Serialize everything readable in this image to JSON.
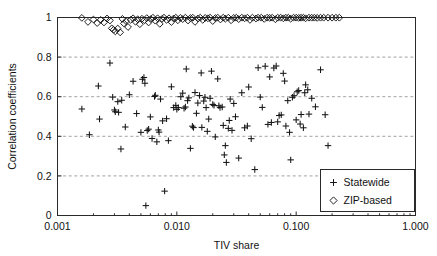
{
  "chart_data": {
    "type": "scatter",
    "title": "",
    "xlabel": "TIV share",
    "ylabel": "Correlation coefficients",
    "xscale": "log",
    "yscale": "linear",
    "xlim": [
      0.001,
      1.0
    ],
    "ylim": [
      0.0,
      1.0
    ],
    "xticks": [
      0.001,
      0.01,
      0.1,
      1.0
    ],
    "xtick_labels": [
      "0.001",
      "0.010",
      "0.100",
      "1.000"
    ],
    "yticks": [
      0,
      0.2,
      0.4,
      0.6,
      0.8,
      1
    ],
    "ytick_labels": [
      "0",
      "0.2",
      "0.4",
      "0.6",
      "0.8",
      "1"
    ],
    "grid": {
      "horizontal": true,
      "vertical": false,
      "style": "dashed",
      "color": "#8a8a8a"
    },
    "legend": {
      "position": "bottom-right",
      "border": true,
      "entries": [
        {
          "label": "Statewide",
          "marker": "plus"
        },
        {
          "label": "ZIP-based",
          "marker": "diamond"
        }
      ]
    },
    "series": [
      {
        "name": "Statewide",
        "marker": "plus",
        "color": "#161616",
        "points": [
          [
            0.0016,
            0.538
          ],
          [
            0.00185,
            0.408
          ],
          [
            0.0022,
            0.654
          ],
          [
            0.00225,
            0.487
          ],
          [
            0.00275,
            0.77
          ],
          [
            0.0029,
            0.598
          ],
          [
            0.003,
            0.533
          ],
          [
            0.00305,
            0.524
          ],
          [
            0.0032,
            0.575
          ],
          [
            0.00325,
            0.521
          ],
          [
            0.0034,
            0.336
          ],
          [
            0.00345,
            0.582
          ],
          [
            0.0037,
            0.447
          ],
          [
            0.004,
            0.61
          ],
          [
            0.0043,
            0.678
          ],
          [
            0.0046,
            0.515
          ],
          [
            0.005,
            0.42
          ],
          [
            0.00515,
            0.688
          ],
          [
            0.0053,
            0.697
          ],
          [
            0.0054,
            0.668
          ],
          [
            0.0055,
            0.05
          ],
          [
            0.00565,
            0.429
          ],
          [
            0.0058,
            0.436
          ],
          [
            0.006,
            0.498
          ],
          [
            0.0062,
            0.389
          ],
          [
            0.0065,
            0.601
          ],
          [
            0.0066,
            0.607
          ],
          [
            0.0068,
            0.372
          ],
          [
            0.007,
            0.432
          ],
          [
            0.0071,
            0.421
          ],
          [
            0.0073,
            0.588
          ],
          [
            0.0076,
            0.478
          ],
          [
            0.0079,
            0.123
          ],
          [
            0.0082,
            0.489
          ],
          [
            0.0085,
            0.378
          ],
          [
            0.009,
            0.65
          ],
          [
            0.0094,
            0.545
          ],
          [
            0.0098,
            0.556
          ],
          [
            0.01,
            0.536
          ],
          [
            0.0103,
            0.545
          ],
          [
            0.0108,
            0.6
          ],
          [
            0.0112,
            0.618
          ],
          [
            0.0115,
            0.542
          ],
          [
            0.0118,
            0.548
          ],
          [
            0.012,
            0.74
          ],
          [
            0.0123,
            0.58
          ],
          [
            0.0126,
            0.594
          ],
          [
            0.013,
            0.339
          ],
          [
            0.0135,
            0.451
          ],
          [
            0.0138,
            0.444
          ],
          [
            0.0142,
            0.621
          ],
          [
            0.0146,
            0.516
          ],
          [
            0.015,
            0.568
          ],
          [
            0.0155,
            0.606
          ],
          [
            0.016,
            0.72
          ],
          [
            0.0162,
            0.445
          ],
          [
            0.0168,
            0.578
          ],
          [
            0.0172,
            0.597
          ],
          [
            0.0176,
            0.545
          ],
          [
            0.018,
            0.425
          ],
          [
            0.0185,
            0.487
          ],
          [
            0.019,
            0.592
          ],
          [
            0.0195,
            0.729
          ],
          [
            0.02,
            0.561
          ],
          [
            0.0205,
            0.556
          ],
          [
            0.021,
            0.397
          ],
          [
            0.022,
            0.69
          ],
          [
            0.0225,
            0.554
          ],
          [
            0.023,
            0.545
          ],
          [
            0.024,
            0.548
          ],
          [
            0.0245,
            0.455
          ],
          [
            0.025,
            0.306
          ],
          [
            0.0255,
            0.353
          ],
          [
            0.026,
            0.268
          ],
          [
            0.027,
            0.44
          ],
          [
            0.0275,
            0.48
          ],
          [
            0.028,
            0.588
          ],
          [
            0.029,
            0.43
          ],
          [
            0.03,
            0.566
          ],
          [
            0.031,
            0.499
          ],
          [
            0.033,
            0.29
          ],
          [
            0.035,
            0.62
          ],
          [
            0.037,
            0.443
          ],
          [
            0.039,
            0.452
          ],
          [
            0.04,
            0.649
          ],
          [
            0.042,
            0.388
          ],
          [
            0.045,
            0.232
          ],
          [
            0.048,
            0.746
          ],
          [
            0.05,
            0.598
          ],
          [
            0.052,
            0.546
          ],
          [
            0.055,
            0.754
          ],
          [
            0.058,
            0.46
          ],
          [
            0.06,
            0.7
          ],
          [
            0.062,
            0.47
          ],
          [
            0.065,
            0.745
          ],
          [
            0.068,
            0.755
          ],
          [
            0.07,
            0.473
          ],
          [
            0.072,
            0.505
          ],
          [
            0.075,
            0.508
          ],
          [
            0.078,
            0.718
          ],
          [
            0.08,
            0.679
          ],
          [
            0.082,
            0.452
          ],
          [
            0.085,
            0.58
          ],
          [
            0.088,
            0.42
          ],
          [
            0.09,
            0.281
          ],
          [
            0.093,
            0.597
          ],
          [
            0.096,
            0.605
          ],
          [
            0.1,
            0.483
          ],
          [
            0.102,
            0.625
          ],
          [
            0.105,
            0.631
          ],
          [
            0.108,
            0.462
          ],
          [
            0.11,
            0.51
          ],
          [
            0.115,
            0.443
          ],
          [
            0.118,
            0.62
          ],
          [
            0.12,
            0.66
          ],
          [
            0.125,
            0.635
          ],
          [
            0.128,
            0.512
          ],
          [
            0.135,
            0.592
          ],
          [
            0.145,
            0.549
          ],
          [
            0.16,
            0.736
          ],
          [
            0.175,
            0.509
          ],
          [
            0.185,
            0.353
          ]
        ]
      },
      {
        "name": "ZIP-based",
        "marker": "diamond",
        "color": "#161616",
        "points": [
          [
            0.0016,
            0.998
          ],
          [
            0.0018,
            0.978
          ],
          [
            0.002,
            0.99
          ],
          [
            0.00215,
            0.972
          ],
          [
            0.0023,
            0.988
          ],
          [
            0.00245,
            0.975
          ],
          [
            0.0026,
            0.995
          ],
          [
            0.00275,
            0.985
          ],
          [
            0.00285,
            0.945
          ],
          [
            0.00295,
            0.938
          ],
          [
            0.00305,
            0.93
          ],
          [
            0.0032,
            0.944
          ],
          [
            0.00335,
            0.925
          ],
          [
            0.0035,
            0.993
          ],
          [
            0.0036,
            0.97
          ],
          [
            0.00375,
            0.982
          ],
          [
            0.0039,
            0.952
          ],
          [
            0.0041,
            0.988
          ],
          [
            0.0043,
            0.996
          ],
          [
            0.0045,
            0.979
          ],
          [
            0.0047,
            0.991
          ],
          [
            0.0049,
            0.966
          ],
          [
            0.0051,
            0.994
          ],
          [
            0.00535,
            0.986
          ],
          [
            0.0056,
            0.997
          ],
          [
            0.0058,
            0.975
          ],
          [
            0.00605,
            0.992
          ],
          [
            0.0063,
            0.999
          ],
          [
            0.0066,
            0.984
          ],
          [
            0.0069,
            0.996
          ],
          [
            0.0072,
            0.968
          ],
          [
            0.0075,
            0.993
          ],
          [
            0.0078,
            0.999
          ],
          [
            0.0082,
            0.988
          ],
          [
            0.0086,
            0.996
          ],
          [
            0.009,
            0.977
          ],
          [
            0.0094,
            0.995
          ],
          [
            0.0098,
            0.999
          ],
          [
            0.0102,
            0.986
          ],
          [
            0.0107,
            0.998
          ],
          [
            0.0112,
            0.992
          ],
          [
            0.0118,
            0.999
          ],
          [
            0.0124,
            0.985
          ],
          [
            0.013,
            0.997
          ],
          [
            0.0136,
            0.999
          ],
          [
            0.0142,
            0.978
          ],
          [
            0.015,
            0.995
          ],
          [
            0.0157,
            0.999
          ],
          [
            0.0165,
            0.988
          ],
          [
            0.0173,
            0.998
          ],
          [
            0.0182,
            0.996
          ],
          [
            0.019,
            0.999
          ],
          [
            0.02,
            0.982
          ],
          [
            0.021,
            0.997
          ],
          [
            0.022,
            0.999
          ],
          [
            0.0232,
            0.99
          ],
          [
            0.0245,
            0.999
          ],
          [
            0.0255,
            0.994
          ],
          [
            0.027,
            0.999
          ],
          [
            0.0285,
            0.986
          ],
          [
            0.03,
            0.998
          ],
          [
            0.0315,
            0.999
          ],
          [
            0.033,
            0.992
          ],
          [
            0.035,
            0.999
          ],
          [
            0.037,
            0.996
          ],
          [
            0.039,
            0.999
          ],
          [
            0.041,
            0.988
          ],
          [
            0.043,
            0.999
          ],
          [
            0.046,
            0.995
          ],
          [
            0.048,
            0.999
          ],
          [
            0.051,
            0.999
          ],
          [
            0.054,
            0.993
          ],
          [
            0.057,
            0.999
          ],
          [
            0.06,
            0.998
          ],
          [
            0.063,
            0.999
          ],
          [
            0.067,
            0.991
          ],
          [
            0.07,
            0.999
          ],
          [
            0.074,
            0.999
          ],
          [
            0.078,
            0.996
          ],
          [
            0.082,
            0.999
          ],
          [
            0.086,
            0.999
          ],
          [
            0.09,
            0.994
          ],
          [
            0.095,
            0.999
          ],
          [
            0.1,
            0.999
          ],
          [
            0.105,
            0.998
          ],
          [
            0.11,
            0.999
          ],
          [
            0.115,
            0.999
          ],
          [
            0.12,
            0.996
          ],
          [
            0.128,
            0.999
          ],
          [
            0.135,
            0.999
          ],
          [
            0.142,
            0.999
          ],
          [
            0.15,
            0.998
          ],
          [
            0.16,
            0.999
          ],
          [
            0.17,
            0.999
          ],
          [
            0.185,
            0.999
          ],
          [
            0.2,
            0.999
          ],
          [
            0.215,
            0.999
          ],
          [
            0.23,
            0.999
          ]
        ]
      }
    ]
  }
}
